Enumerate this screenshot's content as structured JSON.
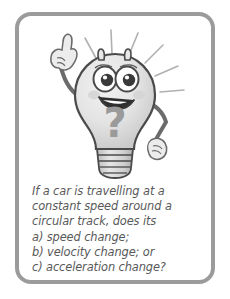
{
  "card": {
    "border_color": "#9b9b9b",
    "background_color": "#ffffff"
  },
  "illustration": {
    "name": "lightbulb-mascot",
    "description": "Smiling cartoon lightbulb character with raised pointing finger, question mark on body and radiating light rays",
    "bulb_fill": "#e2e2e2",
    "bulb_outline": "#4a4a4a",
    "base_fill": "#d0d0d0",
    "question_mark": "?",
    "ray_color": "#b5b5b5"
  },
  "question": {
    "lines": [
      "If a car is travelling at a",
      "constant speed around a",
      "circular track, does its",
      "a) speed change;",
      "b) velocity change; or",
      "c) acceleration change?"
    ],
    "text_color": "#595959"
  }
}
